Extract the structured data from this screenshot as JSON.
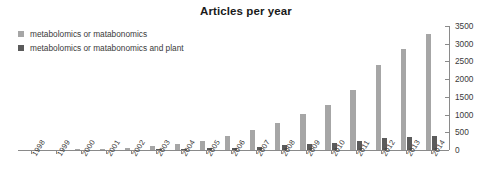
{
  "chart_data": {
    "type": "bar",
    "title": "Articles per year",
    "xlabel": "",
    "ylabel": "",
    "ylim": [
      0,
      3500
    ],
    "yticks": [
      0,
      500,
      1000,
      1500,
      2000,
      2500,
      3000,
      3500
    ],
    "ytick_labels": [
      "0",
      "500",
      "1000",
      "1500",
      "2000",
      "2500",
      "3000",
      "3500"
    ],
    "grid": false,
    "legend_position": "top-left",
    "axis_side": "right",
    "categories": [
      "1998",
      "1999",
      "2000",
      "2001",
      "2002",
      "2003",
      "2004",
      "2005",
      "2006",
      "2007",
      "2008",
      "2009",
      "2010",
      "2011",
      "2012",
      "2013",
      "2014"
    ],
    "series": [
      {
        "name": "metabolomics or matabonomics",
        "color": "#a6a6a6",
        "values": [
          5,
          10,
          20,
          35,
          60,
          110,
          170,
          260,
          400,
          560,
          760,
          1010,
          1280,
          1700,
          2400,
          2850,
          3270
        ]
      },
      {
        "name": "metabolomics or matabonomics and plant",
        "color": "#5b5b5b",
        "values": [
          0,
          0,
          0,
          2,
          5,
          15,
          25,
          45,
          70,
          95,
          130,
          170,
          210,
          260,
          330,
          370,
          400
        ]
      }
    ]
  },
  "legend": {
    "items": [
      {
        "label": "metabolomics or matabonomics",
        "color": "#a6a6a6"
      },
      {
        "label": "metabolomics or matabonomics and plant",
        "color": "#5b5b5b"
      }
    ]
  }
}
